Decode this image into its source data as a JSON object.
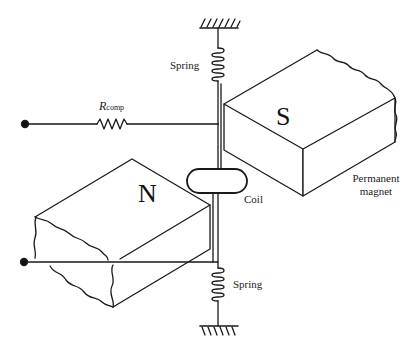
{
  "diagram": {
    "type": "moving-coil galvanometer / meter movement schematic",
    "labels": {
      "spring_top": "Spring",
      "spring_bottom": "Spring",
      "resistor_main": "R",
      "resistor_sub": "comp",
      "coil": "Coil",
      "magnet_line1": "Permanent",
      "magnet_line2": "magnet",
      "north_pole": "N",
      "south_pole": "S"
    },
    "components": [
      {
        "id": "top-ground",
        "kind": "fixed support"
      },
      {
        "id": "top-spring",
        "kind": "spring"
      },
      {
        "id": "r-comp",
        "kind": "resistor"
      },
      {
        "id": "coil",
        "kind": "moving coil"
      },
      {
        "id": "s-magnet",
        "kind": "permanent magnet pole S"
      },
      {
        "id": "n-magnet",
        "kind": "permanent magnet pole N"
      },
      {
        "id": "bottom-spring",
        "kind": "spring"
      },
      {
        "id": "bottom-ground",
        "kind": "fixed support"
      },
      {
        "id": "terminal-top",
        "kind": "terminal"
      },
      {
        "id": "terminal-bottom",
        "kind": "terminal"
      }
    ],
    "colors": {
      "stroke": "#1a1a1a",
      "background": "#ffffff"
    }
  }
}
